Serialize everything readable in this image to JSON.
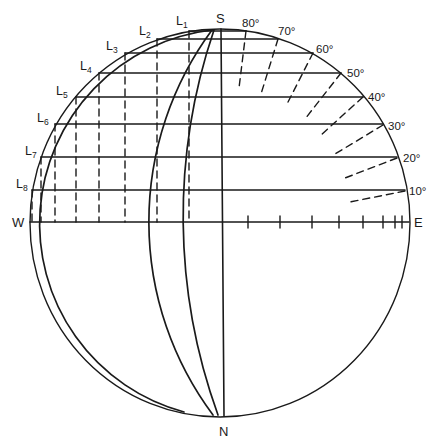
{
  "figure": {
    "type": "stereographic-projection",
    "colors": {
      "ink": "#1a1a1a",
      "background": "#ffffff"
    },
    "poles": {
      "top": "S",
      "bottom": "N",
      "left": "W",
      "right": "E"
    },
    "level_labels": [
      {
        "letter": "L",
        "sub": "1"
      },
      {
        "letter": "L",
        "sub": "2"
      },
      {
        "letter": "L",
        "sub": "3"
      },
      {
        "letter": "L",
        "sub": "4"
      },
      {
        "letter": "L",
        "sub": "5"
      },
      {
        "letter": "L",
        "sub": "6"
      },
      {
        "letter": "L",
        "sub": "7"
      },
      {
        "letter": "L",
        "sub": "8"
      }
    ],
    "angle_labels": [
      "80°",
      "70°",
      "60°",
      "50°",
      "40°",
      "30°",
      "20°",
      "10°"
    ],
    "east_axis_tick_count": 8
  }
}
